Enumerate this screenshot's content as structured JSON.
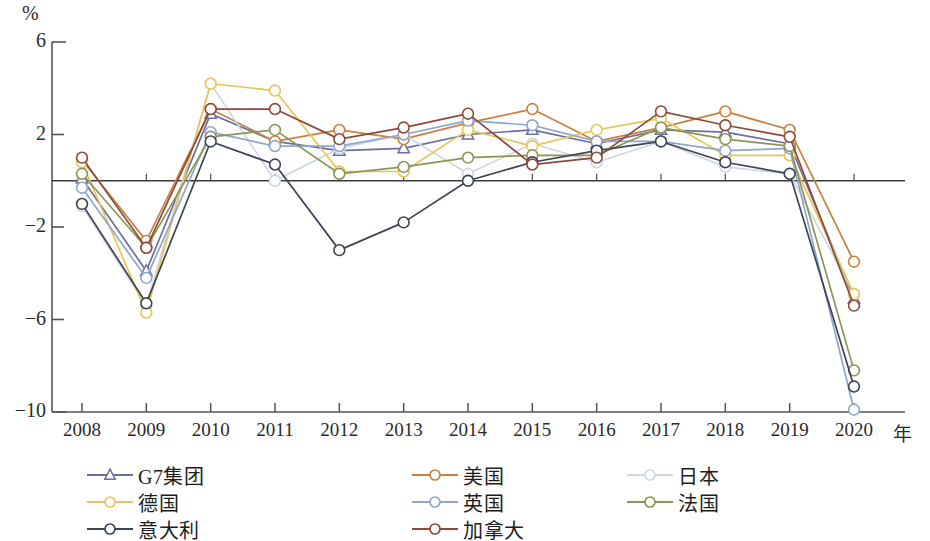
{
  "chart_data": {
    "type": "line",
    "title": "",
    "xlabel": "年",
    "ylabel": "%",
    "x": [
      "2008",
      "2009",
      "2010",
      "2011",
      "2012",
      "2013",
      "2014",
      "2015",
      "2016",
      "2017",
      "2018",
      "2019",
      "2020"
    ],
    "ylim": [
      -10,
      6
    ],
    "yticks": [
      6,
      2,
      -2,
      -6,
      -10
    ],
    "grid": false,
    "zero_line": true,
    "legend_position": "bottom",
    "series": [
      {
        "name": "G7集团",
        "color": "#6a6f9e",
        "marker": "triangle",
        "values": [
          0.1,
          -3.9,
          2.9,
          1.7,
          1.3,
          1.4,
          2.0,
          2.2,
          1.6,
          2.2,
          2.1,
          1.6,
          -5.1
        ]
      },
      {
        "name": "美国",
        "color": "#c8813f",
        "marker": "circle",
        "values": [
          0.9,
          -2.6,
          3.1,
          1.7,
          2.2,
          1.8,
          2.5,
          3.1,
          1.7,
          2.3,
          3.0,
          2.2,
          -3.5
        ]
      },
      {
        "name": "日本",
        "color": "#cfd6e3",
        "marker": "circle",
        "values": [
          -1.1,
          -5.4,
          4.2,
          0.0,
          1.4,
          2.0,
          0.3,
          1.6,
          0.8,
          1.7,
          0.6,
          0.3,
          -4.9
        ]
      },
      {
        "name": "德国",
        "color": "#e8c557",
        "marker": "circle",
        "values": [
          0.8,
          -5.7,
          4.2,
          3.9,
          0.4,
          0.4,
          2.2,
          1.5,
          2.2,
          2.7,
          1.1,
          1.1,
          -4.9
        ]
      },
      {
        "name": "英国",
        "color": "#8fa6cc",
        "marker": "circle",
        "values": [
          -0.3,
          -4.2,
          2.1,
          1.5,
          1.5,
          2.0,
          2.6,
          2.4,
          1.7,
          1.7,
          1.3,
          1.4,
          -9.9
        ]
      },
      {
        "name": "法国",
        "color": "#8a9655",
        "marker": "circle",
        "values": [
          0.3,
          -2.9,
          1.9,
          2.2,
          0.3,
          0.6,
          1.0,
          1.1,
          1.1,
          2.3,
          1.8,
          1.5,
          -8.2
        ]
      },
      {
        "name": "意大利",
        "color": "#3e4355",
        "marker": "circle",
        "values": [
          -1.0,
          -5.3,
          1.7,
          0.7,
          -3.0,
          -1.8,
          0.0,
          0.8,
          1.3,
          1.7,
          0.8,
          0.3,
          -8.9
        ]
      },
      {
        "name": "加拿大",
        "color": "#8c4a3a",
        "marker": "circle",
        "values": [
          1.0,
          -2.9,
          3.1,
          3.1,
          1.8,
          2.3,
          2.9,
          0.7,
          1.0,
          3.0,
          2.4,
          1.9,
          -5.4
        ]
      }
    ]
  },
  "axis": {
    "y_unit": "%",
    "x_unit": "年",
    "y_tick_labels": [
      "6",
      "2",
      "−2",
      "−6",
      "−10"
    ],
    "x_tick_labels": [
      "2008",
      "2009",
      "2010",
      "2011",
      "2012",
      "2013",
      "2014",
      "2015",
      "2016",
      "2017",
      "2018",
      "2019",
      "2020"
    ]
  },
  "legend": {
    "items": [
      {
        "label": "G7集团",
        "color": "#6a6f9e",
        "marker": "triangle",
        "col": 0,
        "row": 0
      },
      {
        "label": "美国",
        "color": "#c8813f",
        "marker": "circle",
        "col": 1,
        "row": 0
      },
      {
        "label": "日本",
        "color": "#cfd6e3",
        "marker": "circle",
        "col": 2,
        "row": 0
      },
      {
        "label": "德国",
        "color": "#e8c557",
        "marker": "circle",
        "col": 0,
        "row": 1
      },
      {
        "label": "英国",
        "color": "#8fa6cc",
        "marker": "circle",
        "col": 1,
        "row": 1
      },
      {
        "label": "法国",
        "color": "#8a9655",
        "marker": "circle",
        "col": 2,
        "row": 1
      },
      {
        "label": "意大利",
        "color": "#3e4355",
        "marker": "circle",
        "col": 0,
        "row": 2
      },
      {
        "label": "加拿大",
        "color": "#8c4a3a",
        "marker": "circle",
        "col": 1,
        "row": 2
      }
    ]
  },
  "style": {
    "axis_color": "#555555",
    "background": "#ffffff",
    "marker_fill": "#ffffff"
  }
}
